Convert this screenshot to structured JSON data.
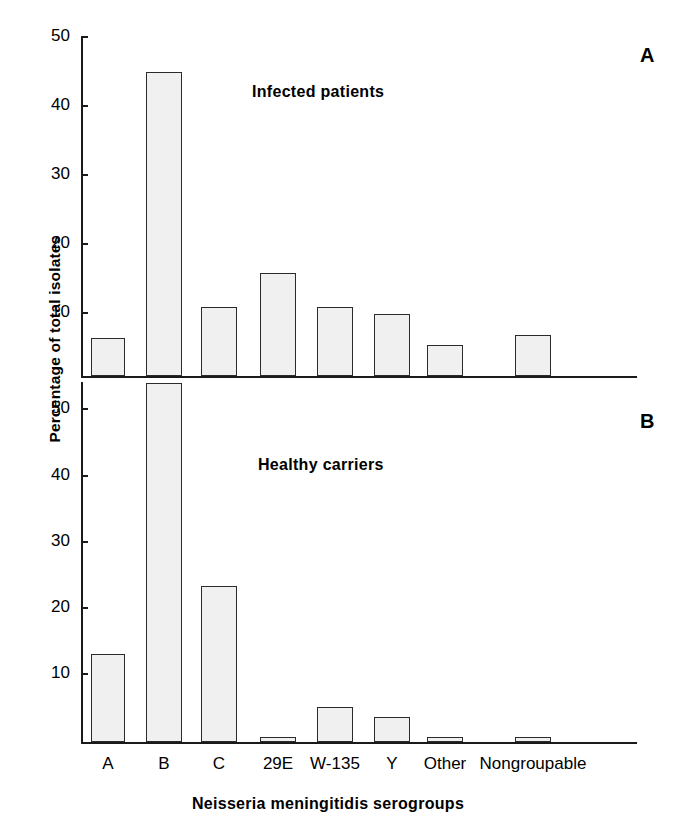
{
  "figure": {
    "ylabel": "Percentage of total isolates",
    "xlabel": "Neissería meningitidis serogroups",
    "xlabel_text": "Neisseria meningitidis serogroups"
  },
  "panels": [
    {
      "letter": "A",
      "caption": "Infected patients",
      "yticks": [
        "50",
        "40",
        "30",
        "20",
        "10"
      ]
    },
    {
      "letter": "B",
      "caption": "Healthy carriers",
      "yticks": [
        "50",
        "40",
        "30",
        "20",
        "10"
      ]
    }
  ],
  "xticks": [
    "A",
    "B",
    "C",
    "29E",
    "W-135",
    "Y",
    "Other",
    "Nongroupable"
  ],
  "colors": {
    "bar_fill": "#f0f0f0",
    "bar_stroke": "#2b2b2b",
    "axis": "#1a1a1a",
    "background": "#ffffff"
  },
  "chart_data": [
    {
      "type": "bar",
      "title": "Infected patients",
      "panel": "A",
      "categories": [
        "A",
        "B",
        "C",
        "29E",
        "W-135",
        "Y",
        "Other",
        "Nongroupable"
      ],
      "values": [
        5.5,
        44,
        10,
        15,
        10,
        9,
        4.5,
        6
      ],
      "xlabel": "Neisseria meningitidis serogroups",
      "ylabel": "Percentage of total isolates",
      "ylim": [
        0,
        50
      ],
      "ytick_values": [
        10,
        20,
        30,
        40,
        50
      ],
      "grid": false,
      "legend": "none"
    },
    {
      "type": "bar",
      "title": "Healthy carriers",
      "panel": "B",
      "categories": [
        "A",
        "B",
        "C",
        "29E",
        "W-135",
        "Y",
        "Other",
        "Nongroupable"
      ],
      "values": [
        13.3,
        54,
        23.5,
        0.7,
        5.3,
        3.7,
        0.8,
        0.8
      ],
      "xlabel": "Neisseria meningitidis serogroups",
      "ylabel": "Percentage of total isolates",
      "ylim": [
        0,
        54
      ],
      "ytick_values": [
        10,
        20,
        30,
        40,
        50
      ],
      "grid": false,
      "legend": "none"
    }
  ]
}
